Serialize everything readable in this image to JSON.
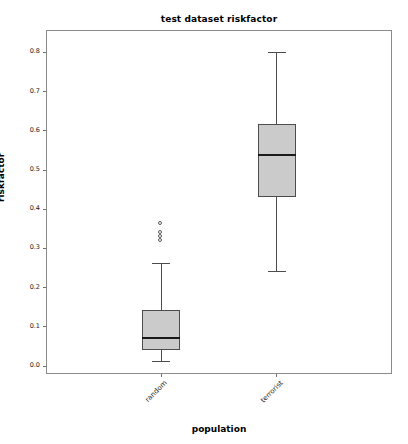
{
  "chart_data": {
    "type": "box",
    "title": "test dataset riskfactor",
    "xlabel": "population",
    "ylabel": "riskfactor",
    "categories": [
      "random",
      "terrorist"
    ],
    "ylim": [
      -0.02,
      0.857
    ],
    "yticks": [
      0.0,
      0.1,
      0.2,
      0.3,
      0.4,
      0.5,
      0.6,
      0.7,
      0.8
    ],
    "ytick_labels": [
      "0.0",
      "0.1",
      "0.2",
      "0.3",
      "0.4",
      "0.5",
      "0.6",
      "0.7",
      "0.8"
    ],
    "grid": false,
    "legend": "none",
    "box_fill_color": "#cbcbcb",
    "box_edge_color": "#4d4d4d",
    "median_color": "#1a1a1a",
    "boxes": [
      {
        "label": "random",
        "whisker_low": 0.012,
        "q1": 0.04,
        "median": 0.072,
        "q3": 0.142,
        "whisker_high": 0.264,
        "outliers": [
          0.363,
          0.34,
          0.328,
          0.318
        ]
      },
      {
        "label": "terrorist",
        "whisker_low": 0.242,
        "q1": 0.431,
        "median": 0.538,
        "q3": 0.618,
        "whisker_high": 0.8,
        "outliers": []
      }
    ]
  },
  "axis": {
    "y_label": "riskfactor",
    "x_label": "population",
    "y_tick_labels": [
      "0.8",
      "0.7",
      "0.6",
      "0.5",
      "0.4",
      "0.3",
      "0.2",
      "0.1",
      "0.0"
    ],
    "x_tick_labels": [
      "random",
      "terrorist"
    ]
  },
  "title": {
    "text": "test dataset riskfactor"
  }
}
